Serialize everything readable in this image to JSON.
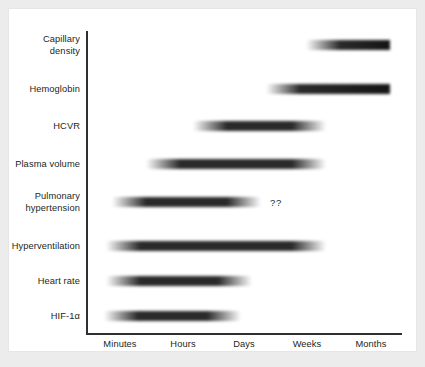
{
  "figure": {
    "background_color": "#ececed",
    "panel_color": "#ffffff",
    "axis_color": "#2f2f33",
    "text_color": "#231f20",
    "annotation": "??"
  },
  "chart_data": {
    "type": "bar",
    "title": "",
    "xlabel": "",
    "ylabel": "",
    "grid": false,
    "legend": null,
    "x_tick_labels": [
      "Minutes",
      "Hours",
      "Days",
      "Weeks",
      "Months"
    ],
    "x_tick_positions_px": [
      111,
      174,
      235,
      298,
      362
    ],
    "categories": [
      "Capillary density",
      "Hemoglobin",
      "HCVR",
      "Plasma volume",
      "Pulmonary hypertension",
      "Hyperventilation",
      "Heart rate",
      "HIF-1α"
    ],
    "bars": [
      {
        "label": "Capillary density",
        "label_lines": "Capillary\ndensity",
        "start_tick": "Weeks",
        "end_tick": "Months",
        "start_px": 297,
        "end_px": 381,
        "row_center_px": 36,
        "fade_in": true,
        "fade_out": false,
        "note": null
      },
      {
        "label": "Hemoglobin",
        "label_lines": "Hemoglobin",
        "start_tick": "Weeks",
        "end_tick": "Months",
        "start_px": 257,
        "end_px": 381,
        "row_center_px": 80,
        "fade_in": true,
        "fade_out": false,
        "note": null
      },
      {
        "label": "HCVR",
        "label_lines": "HCVR",
        "start_tick": "Hours",
        "end_tick": "Weeks",
        "start_px": 184,
        "end_px": 317,
        "row_center_px": 117,
        "fade_in": true,
        "fade_out": true,
        "note": null
      },
      {
        "label": "Plasma volume",
        "label_lines": "Plasma volume",
        "start_tick": "Hours",
        "end_tick": "Weeks",
        "start_px": 137,
        "end_px": 317,
        "row_center_px": 155,
        "fade_in": true,
        "fade_out": true,
        "note": null
      },
      {
        "label": "Pulmonary hypertension",
        "label_lines": "Pulmonary\nhypertension",
        "start_tick": "Minutes",
        "end_tick": "Days",
        "start_px": 103,
        "end_px": 252,
        "row_center_px": 193,
        "fade_in": true,
        "fade_out": true,
        "note": "??"
      },
      {
        "label": "Hyperventilation",
        "label_lines": "Hyperventilation",
        "start_tick": "Minutes",
        "end_tick": "Weeks",
        "start_px": 97,
        "end_px": 317,
        "row_center_px": 237,
        "fade_in": true,
        "fade_out": true,
        "note": null
      },
      {
        "label": "Heart rate",
        "label_lines": "Heart rate",
        "start_tick": "Minutes",
        "end_tick": "Days",
        "start_px": 97,
        "end_px": 243,
        "row_center_px": 272,
        "fade_in": true,
        "fade_out": true,
        "note": null
      },
      {
        "label": "HIF-1α",
        "label_lines": "HIF-1α",
        "start_tick": "Minutes",
        "end_tick": "Days",
        "start_px": 95,
        "end_px": 232,
        "row_center_px": 307,
        "fade_in": true,
        "fade_out": true,
        "note": null
      }
    ]
  },
  "annotation_position_px": {
    "x": 261,
    "y": 188
  }
}
